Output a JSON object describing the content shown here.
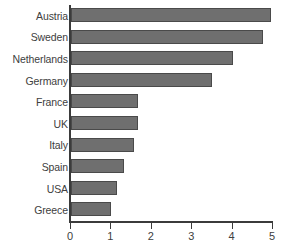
{
  "chart_data": {
    "type": "bar",
    "orientation": "horizontal",
    "title": "",
    "subtitle": "",
    "xlabel": "",
    "ylabel": "",
    "categories": [
      "Austria",
      "Sweden",
      "Netherlands",
      "Germany",
      "France",
      "UK",
      "Italy",
      "Spain",
      "USA",
      "Greece"
    ],
    "values": [
      4.95,
      4.75,
      4.0,
      3.5,
      1.65,
      1.65,
      1.55,
      1.3,
      1.15,
      1.0
    ],
    "xlim": [
      0,
      5
    ],
    "xticks": [
      0,
      1,
      2,
      3,
      4,
      5
    ],
    "xtick_labels": [
      "0",
      "1",
      "2",
      "3",
      "4",
      "5"
    ],
    "grid": false,
    "legend": null,
    "annotations": [],
    "bar_color": "#6f6f6f",
    "bar_border_color": "#4a4a4a",
    "axis_color": "#3b3b3b",
    "text_color": "#404040",
    "background_color": "#ffffff"
  }
}
